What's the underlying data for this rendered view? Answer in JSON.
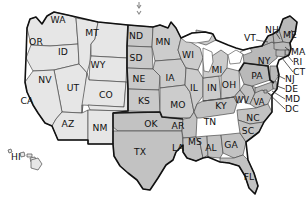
{
  "map": {
    "title": "United States state map with regional shading",
    "projection_note": "contiguous US with Hawaii inset",
    "background_color": "#ffffff",
    "colors": {
      "west_fill": "#e6e6e6",
      "plains_fill": "#c9c9c9",
      "south_fill": "#c2c2c2",
      "midwest_fill": "#cccccc",
      "northeast_fill": "#b9b9b9",
      "state_border": "#4a4a4a",
      "region_border": "#1a1a1a",
      "label_color": "#111111",
      "lake_fill": "#ffffff"
    },
    "regions": [
      {
        "name": "West",
        "fill": "#e6e6e6"
      },
      {
        "name": "Plains",
        "fill": "#c9c9c9"
      },
      {
        "name": "Midwest",
        "fill": "#cccccc"
      },
      {
        "name": "South",
        "fill": "#c2c2c2"
      },
      {
        "name": "Northeast",
        "fill": "#b9b9b9"
      }
    ],
    "states": [
      {
        "code": "WA",
        "x": 58,
        "y": 20,
        "region": "West"
      },
      {
        "code": "OR",
        "x": 36,
        "y": 42,
        "region": "West"
      },
      {
        "code": "ID",
        "x": 63,
        "y": 52,
        "region": "West"
      },
      {
        "code": "MT",
        "x": 92,
        "y": 33,
        "region": "West"
      },
      {
        "code": "WY",
        "x": 98,
        "y": 65,
        "region": "West"
      },
      {
        "code": "NV",
        "x": 45,
        "y": 80,
        "region": "West"
      },
      {
        "code": "UT",
        "x": 73,
        "y": 88,
        "region": "West"
      },
      {
        "code": "CO",
        "x": 106,
        "y": 95,
        "region": "West"
      },
      {
        "code": "CA",
        "x": 27,
        "y": 101,
        "region": "West"
      },
      {
        "code": "AZ",
        "x": 68,
        "y": 124,
        "region": "West"
      },
      {
        "code": "NM",
        "x": 100,
        "y": 128,
        "region": "West"
      },
      {
        "code": "ND",
        "x": 136,
        "y": 36,
        "region": "Plains"
      },
      {
        "code": "SD",
        "x": 136,
        "y": 58,
        "region": "Plains"
      },
      {
        "code": "NE",
        "x": 139,
        "y": 79,
        "region": "Plains"
      },
      {
        "code": "KS",
        "x": 144,
        "y": 101,
        "region": "Plains"
      },
      {
        "code": "OK",
        "x": 151,
        "y": 124,
        "region": "South"
      },
      {
        "code": "TX",
        "x": 140,
        "y": 152,
        "region": "South"
      },
      {
        "code": "MN",
        "x": 163,
        "y": 42,
        "region": "Midwest"
      },
      {
        "code": "IA",
        "x": 170,
        "y": 78,
        "region": "Midwest"
      },
      {
        "code": "MO",
        "x": 178,
        "y": 105,
        "region": "Midwest"
      },
      {
        "code": "WI",
        "x": 188,
        "y": 55,
        "region": "Midwest"
      },
      {
        "code": "IL",
        "x": 194,
        "y": 88,
        "region": "Midwest"
      },
      {
        "code": "IN",
        "x": 212,
        "y": 88,
        "region": "Midwest"
      },
      {
        "code": "MI",
        "x": 217,
        "y": 70,
        "region": "Midwest"
      },
      {
        "code": "OH",
        "x": 229,
        "y": 85,
        "region": "Midwest"
      },
      {
        "code": "AR",
        "x": 178,
        "y": 126,
        "region": "South"
      },
      {
        "code": "LA",
        "x": 178,
        "y": 148,
        "region": "South"
      },
      {
        "code": "MS",
        "x": 195,
        "y": 142,
        "region": "South"
      },
      {
        "code": "AL",
        "x": 211,
        "y": 148,
        "region": "South"
      },
      {
        "code": "GA",
        "x": 231,
        "y": 145,
        "region": "South"
      },
      {
        "code": "FL",
        "x": 249,
        "y": 177,
        "region": "South"
      },
      {
        "code": "TN",
        "x": 210,
        "y": 122,
        "region": "South"
      },
      {
        "code": "KY",
        "x": 221,
        "y": 106,
        "region": "South"
      },
      {
        "code": "WV",
        "x": 242,
        "y": 100,
        "region": "South"
      },
      {
        "code": "VA",
        "x": 259,
        "y": 102,
        "region": "South"
      },
      {
        "code": "NC",
        "x": 253,
        "y": 118,
        "region": "South"
      },
      {
        "code": "SC",
        "x": 248,
        "y": 131,
        "region": "South"
      },
      {
        "code": "PA",
        "x": 257,
        "y": 76,
        "region": "Northeast"
      },
      {
        "code": "NY",
        "x": 264,
        "y": 61,
        "region": "Northeast"
      },
      {
        "code": "VT",
        "x": 250,
        "y": 38,
        "region": "Northeast"
      },
      {
        "code": "NH",
        "x": 272,
        "y": 30,
        "region": "Northeast"
      },
      {
        "code": "ME",
        "x": 290,
        "y": 35,
        "region": "Northeast"
      },
      {
        "code": "HI",
        "x": 16,
        "y": 157,
        "region": "West"
      }
    ],
    "callout_labels": [
      {
        "code": "MA",
        "x": 293,
        "y": 52
      },
      {
        "code": "RI",
        "x": 295,
        "y": 62
      },
      {
        "code": "CT",
        "x": 295,
        "y": 72
      },
      {
        "code": "NJ",
        "x": 286,
        "y": 79
      },
      {
        "code": "DE",
        "x": 286,
        "y": 89
      },
      {
        "code": "MD",
        "x": 286,
        "y": 99
      },
      {
        "code": "DC",
        "x": 286,
        "y": 109
      }
    ],
    "marker": {
      "name": "pin-marker",
      "x": 139,
      "y": 5
    }
  }
}
